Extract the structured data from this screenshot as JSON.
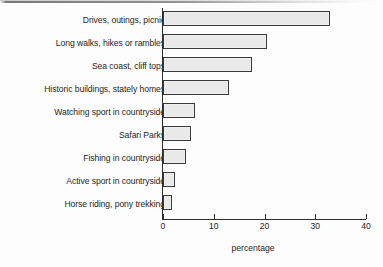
{
  "chart_data": {
    "type": "bar",
    "orientation": "horizontal",
    "title": "",
    "subtitle": "",
    "xlabel": "percentage",
    "ylabel": "",
    "xlim": [
      0,
      40
    ],
    "xticks": [
      0,
      10,
      20,
      30,
      40
    ],
    "xtick_labels": [
      "0",
      "10",
      "20",
      "30",
      "40"
    ],
    "grid": false,
    "legend": null,
    "categories": [
      "Drives, outings, picnic",
      "Long walks, hikes or rambles",
      "Sea coast, cliff tops",
      "Historic buildings, stately homes",
      "Watching sport in countryside",
      "Safari Parks",
      "Fishing in countryside",
      "Active sport in countryside",
      "Horse riding, pony trekking"
    ],
    "values": [
      33,
      20.5,
      17.5,
      13,
      6.3,
      5.5,
      4.5,
      2.3,
      1.7
    ],
    "colors": {
      "bar_fill": "#e9e9e9",
      "bar_border": "#3a3a3a",
      "axis": "#2e2e2e",
      "text": "#1d1d1d",
      "background": "#fdfdfd"
    }
  }
}
